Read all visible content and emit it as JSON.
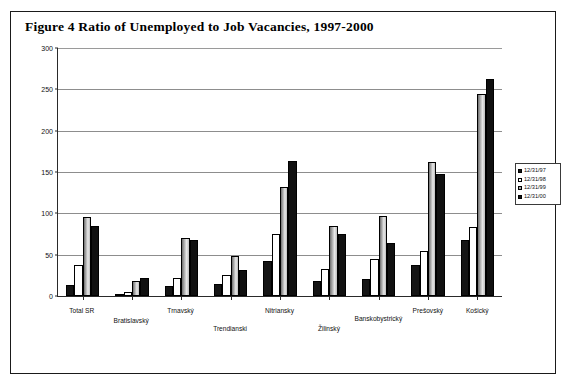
{
  "figure": {
    "title": "Figure 4  Ratio of Unemployed to Job Vacancies, 1997-2000"
  },
  "legend": {
    "position": "right",
    "items": [
      {
        "label": "12/31/97",
        "swatch": "black-swatch-icon"
      },
      {
        "label": "12/31/98",
        "swatch": "white-swatch-icon"
      },
      {
        "label": "12/31/99",
        "swatch": "gray-swatch-icon"
      },
      {
        "label": "12/31/00",
        "swatch": "black-swatch-icon"
      }
    ]
  },
  "chart_data": {
    "type": "bar",
    "title": "Figure 4  Ratio of Unemployed to Job Vacancies, 1997-2000",
    "xlabel": "",
    "ylabel": "",
    "ylim": [
      0,
      300
    ],
    "yticks": [
      0,
      50,
      100,
      150,
      200,
      250,
      300
    ],
    "ytick_labels": [
      "0",
      "50",
      "100",
      "150",
      "200",
      "250",
      "300"
    ],
    "grid": true,
    "categories": [
      "Total SR",
      "Bratislavský",
      "Trnavský",
      "Trendianski",
      "Nitriansky",
      "Žilinský",
      "Banskobystrický",
      "Prešovský",
      "Košický"
    ],
    "series": [
      {
        "name": "12/31/97",
        "values": [
          13,
          3,
          12,
          14,
          42,
          18,
          20,
          38,
          68
        ]
      },
      {
        "name": "12/31/98",
        "values": [
          38,
          5,
          22,
          25,
          75,
          33,
          45,
          55,
          83
        ]
      },
      {
        "name": "12/31/99",
        "values": [
          95,
          18,
          70,
          48,
          132,
          85,
          97,
          162,
          244
        ]
      },
      {
        "name": "12/31/00",
        "values": [
          85,
          22,
          68,
          32,
          163,
          75,
          64,
          148,
          262
        ]
      }
    ]
  }
}
